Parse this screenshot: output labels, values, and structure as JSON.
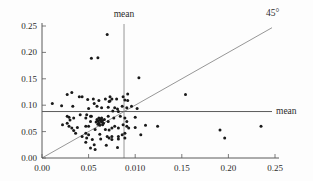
{
  "figure": {
    "background": "#fdfdfd"
  },
  "chart_data": {
    "type": "scatter",
    "title": "",
    "xlabel": "",
    "ylabel": "",
    "xlim": [
      0,
      0.25
    ],
    "ylim": [
      0,
      0.25
    ],
    "grid": false,
    "legend": null,
    "x_tick_values": [
      0,
      0.05,
      0.1,
      0.15,
      0.2,
      0.25
    ],
    "x_tick_labels": [
      "0.00",
      "0.05",
      "0.010",
      "0.15",
      "0.20",
      "0.25"
    ],
    "y_tick_values": [
      0,
      0.05,
      0.1,
      0.15,
      0.2,
      0.25
    ],
    "y_tick_labels": [
      "0.00",
      "0.05",
      "0.10",
      "0.15",
      "0.20",
      "0.25"
    ],
    "mean_x": 0.088,
    "mean_y": 0.088,
    "diagonal_end": 0.2468,
    "annotations": {
      "vertical_mean_label": "mean",
      "horizontal_mean_label": "mean",
      "diagonal_label": "45°"
    },
    "reference_lines": [
      {
        "name": "vertical-mean",
        "x": 0.088
      },
      {
        "name": "horizontal-mean",
        "y": 0.088
      },
      {
        "name": "45-degree",
        "from": [
          0,
          0
        ],
        "slope": 1
      }
    ],
    "colors": {
      "point": "#1a1a1a",
      "line": "#5a5a5a",
      "text": "#2b2b2b"
    },
    "points": [
      [
        0.07,
        0.234
      ],
      [
        0.053,
        0.189
      ],
      [
        0.06,
        0.19
      ],
      [
        0.104,
        0.152
      ],
      [
        0.154,
        0.12
      ],
      [
        0.191,
        0.053
      ],
      [
        0.196,
        0.038
      ],
      [
        0.235,
        0.06
      ],
      [
        0.124,
        0.06
      ],
      [
        0.111,
        0.062
      ],
      [
        0.106,
        0.044
      ],
      [
        0.027,
        0.12
      ],
      [
        0.032,
        0.124
      ],
      [
        0.04,
        0.116
      ],
      [
        0.043,
        0.116
      ],
      [
        0.011,
        0.103
      ],
      [
        0.021,
        0.099
      ],
      [
        0.033,
        0.098
      ],
      [
        0.049,
        0.111
      ],
      [
        0.055,
        0.112
      ],
      [
        0.061,
        0.109
      ],
      [
        0.068,
        0.112
      ],
      [
        0.073,
        0.116
      ],
      [
        0.075,
        0.112
      ],
      [
        0.073,
        0.108
      ],
      [
        0.08,
        0.112
      ],
      [
        0.092,
        0.109
      ],
      [
        0.092,
        0.121
      ],
      [
        0.087,
        0.116
      ],
      [
        0.056,
        0.103
      ],
      [
        0.072,
        0.107
      ],
      [
        0.089,
        0.11
      ],
      [
        0.05,
        0.094
      ],
      [
        0.059,
        0.098
      ],
      [
        0.064,
        0.095
      ],
      [
        0.071,
        0.096
      ],
      [
        0.078,
        0.095
      ],
      [
        0.086,
        0.098
      ],
      [
        0.091,
        0.095
      ],
      [
        0.096,
        0.098
      ],
      [
        0.102,
        0.094
      ],
      [
        0.081,
        0.093
      ],
      [
        0.076,
        0.089
      ],
      [
        0.082,
        0.088
      ],
      [
        0.048,
        0.082
      ],
      [
        0.053,
        0.079
      ],
      [
        0.071,
        0.079
      ],
      [
        0.077,
        0.076
      ],
      [
        0.084,
        0.079
      ],
      [
        0.089,
        0.076
      ],
      [
        0.027,
        0.079
      ],
      [
        0.029,
        0.077
      ],
      [
        0.03,
        0.072
      ],
      [
        0.034,
        0.076
      ],
      [
        0.041,
        0.082
      ],
      [
        0.047,
        0.076
      ],
      [
        0.052,
        0.079
      ],
      [
        0.1,
        0.077
      ],
      [
        0.06,
        0.07
      ],
      [
        0.062,
        0.072
      ],
      [
        0.064,
        0.068
      ],
      [
        0.061,
        0.066
      ],
      [
        0.063,
        0.074
      ],
      [
        0.065,
        0.071
      ],
      [
        0.059,
        0.073
      ],
      [
        0.06,
        0.064
      ],
      [
        0.066,
        0.066
      ],
      [
        0.064,
        0.076
      ],
      [
        0.062,
        0.062
      ],
      [
        0.058,
        0.068
      ],
      [
        0.067,
        0.073
      ],
      [
        0.065,
        0.063
      ],
      [
        0.063,
        0.07
      ],
      [
        0.061,
        0.076
      ],
      [
        0.022,
        0.063
      ],
      [
        0.027,
        0.066
      ],
      [
        0.032,
        0.057
      ],
      [
        0.052,
        0.069
      ],
      [
        0.047,
        0.06
      ],
      [
        0.05,
        0.06
      ],
      [
        0.057,
        0.054
      ],
      [
        0.068,
        0.054
      ],
      [
        0.075,
        0.057
      ],
      [
        0.082,
        0.057
      ],
      [
        0.091,
        0.06
      ],
      [
        0.071,
        0.069
      ],
      [
        0.078,
        0.06
      ],
      [
        0.087,
        0.063
      ],
      [
        0.091,
        0.069
      ],
      [
        0.093,
        0.057
      ],
      [
        0.1,
        0.058
      ],
      [
        0.029,
        0.06
      ],
      [
        0.034,
        0.052
      ],
      [
        0.038,
        0.058
      ],
      [
        0.072,
        0.053
      ],
      [
        0.036,
        0.047
      ],
      [
        0.043,
        0.041
      ],
      [
        0.05,
        0.044
      ],
      [
        0.047,
        0.047
      ],
      [
        0.048,
        0.038
      ],
      [
        0.054,
        0.035
      ],
      [
        0.062,
        0.045
      ],
      [
        0.063,
        0.036
      ],
      [
        0.07,
        0.041
      ],
      [
        0.075,
        0.041
      ],
      [
        0.082,
        0.041
      ],
      [
        0.072,
        0.038
      ],
      [
        0.075,
        0.035
      ],
      [
        0.082,
        0.036
      ],
      [
        0.086,
        0.044
      ],
      [
        0.089,
        0.047
      ],
      [
        0.089,
        0.038
      ],
      [
        0.056,
        0.025
      ],
      [
        0.052,
        0.019
      ],
      [
        0.057,
        0.016
      ],
      [
        0.069,
        0.024
      ],
      [
        0.081,
        0.02
      ],
      [
        0.047,
        0.03
      ]
    ]
  }
}
